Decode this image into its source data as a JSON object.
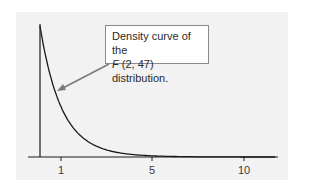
{
  "chart_data": {
    "type": "line",
    "title": "",
    "xlabel": "",
    "ylabel": "",
    "xlim": [
      0,
      11.5
    ],
    "ylim": [
      0,
      1.0
    ],
    "grid": false,
    "legend": null,
    "x_ticks": [
      1,
      5,
      10
    ],
    "x_tick_labels": [
      "1",
      "5",
      "10"
    ],
    "series": [
      {
        "name": "F(2, 47) density",
        "x": [
          0,
          0.25,
          0.5,
          0.75,
          1,
          1.5,
          2,
          2.5,
          3,
          4,
          5,
          6,
          7,
          8,
          10
        ],
        "y": [
          1.0,
          0.78,
          0.61,
          0.47,
          0.37,
          0.23,
          0.14,
          0.09,
          0.058,
          0.025,
          0.012,
          0.006,
          0.003,
          0.0015,
          0.0004
        ]
      }
    ],
    "annotations": [
      {
        "text_line1": "Density curve of the",
        "text_line2_italic": "F",
        "text_line2_rest": " (2, 47) distribution.",
        "arrow_to_x": 0.75,
        "arrow_to_y": 0.47
      }
    ]
  },
  "colors": {
    "panel": "#f2f2f2",
    "curve": "#1a1a1a",
    "axis": "#1a1a1a",
    "arrow": "#7a7a7a",
    "callout_border": "#8a8a8a"
  }
}
